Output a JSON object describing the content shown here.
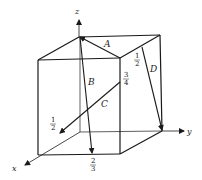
{
  "diagram": {
    "type": "unit-cube-vectors",
    "axes": {
      "x": "x",
      "y": "y",
      "z": "z"
    },
    "vectors": [
      {
        "label": "A"
      },
      {
        "label": "B"
      },
      {
        "label": "C"
      },
      {
        "label": "D"
      }
    ],
    "fractions": [
      {
        "num": "1",
        "den": "2",
        "near": "D top"
      },
      {
        "num": "3",
        "den": "4",
        "near": "C end"
      },
      {
        "num": "1",
        "den": "2",
        "near": "C start on x-axis"
      },
      {
        "num": "2",
        "den": "3",
        "near": "B end"
      }
    ],
    "colors": {
      "line": "#1a1a1a",
      "background": "#ffffff"
    }
  }
}
